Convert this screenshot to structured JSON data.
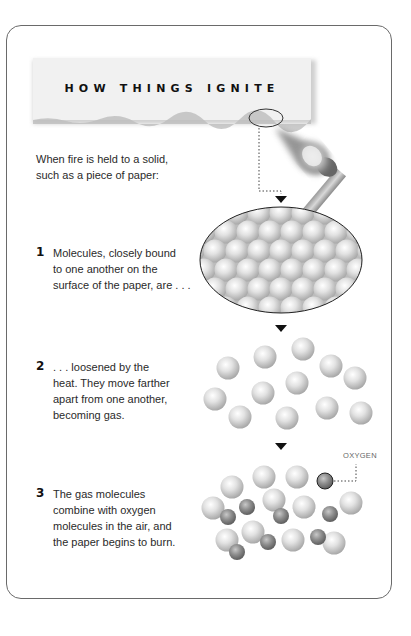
{
  "title": "HOW THINGS IGNITE",
  "intro": {
    "line1": "When fire is held to a solid,",
    "line2": "such as a piece of paper:"
  },
  "steps": [
    {
      "number": "1",
      "lines": [
        "Molecules, closely bound",
        "to one another on the",
        "surface of the paper, are  . . ."
      ],
      "illustration": "tightly-packed-molecules"
    },
    {
      "number": "2",
      "lines": [
        ". . .  loosened by the",
        "heat. They move farther",
        "apart from one another,",
        "becoming gas."
      ],
      "illustration": "loose-gas-molecules"
    },
    {
      "number": "3",
      "lines": [
        "The gas molecules",
        "combine with oxygen",
        "molecules in the air, and",
        "the paper begins to burn."
      ],
      "illustration": "gas-and-oxygen-molecules"
    }
  ],
  "labels": {
    "oxygen": "OXYGEN"
  },
  "icons": {
    "match": "lit-match-icon",
    "arrow": "down-arrow-icon"
  },
  "colors": {
    "frame": "#6a6a6a",
    "molecule_light": "#d9d9d9",
    "molecule_oxygen": "#8f8f8f",
    "text": "#2a2a2a"
  }
}
